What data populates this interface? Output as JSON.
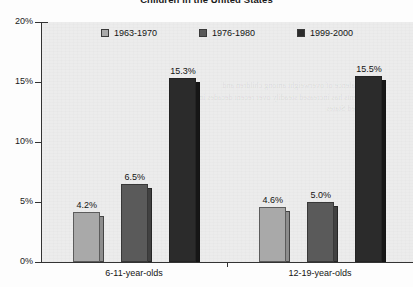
{
  "chart_data": {
    "type": "bar",
    "title": "Children in the United States",
    "xlabel": "",
    "ylabel": "",
    "ylim": [
      0,
      20
    ],
    "ytick_labels": [
      "0%",
      "5%",
      "10%",
      "15%",
      "20%"
    ],
    "ytick_values": [
      0,
      5,
      10,
      15,
      20
    ],
    "grid": false,
    "legend_position": "top-center",
    "categories": [
      "6-11-year-olds",
      "12-19-year-olds"
    ],
    "series": [
      {
        "name": "1963-1970",
        "color": "#a9a9a9",
        "side_color": "#8d8d8d",
        "values": [
          4.2,
          4.6
        ],
        "labels": [
          "4.2%",
          "4.6%"
        ]
      },
      {
        "name": "1976-1980",
        "color": "#5a5a5a",
        "side_color": "#414141",
        "values": [
          6.5,
          5.0
        ],
        "labels": [
          "6.5%",
          "5.0%"
        ]
      },
      {
        "name": "1999-2000",
        "color": "#2b2b2b",
        "side_color": "#161616",
        "values": [
          15.3,
          15.5
        ],
        "labels": [
          "15.3%",
          "15.5%"
        ]
      }
    ],
    "plot_background": "#ececec",
    "axis_color": "#333333"
  },
  "artifacts": {
    "bleed_through_text": "the prevalence of overweight among children and adolescents has increased steadily over recent decades in the United States"
  }
}
